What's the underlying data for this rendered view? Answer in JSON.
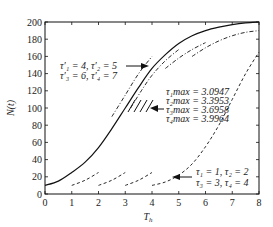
{
  "chart_data": {
    "type": "line",
    "title": "",
    "xlabel": "T_h",
    "ylabel": "N(t)",
    "xlim": [
      0,
      8
    ],
    "ylim": [
      0,
      200
    ],
    "xticks": [
      0,
      1,
      2,
      3,
      4,
      5,
      6,
      7,
      8
    ],
    "yticks": [
      0,
      20,
      40,
      60,
      80,
      100,
      120,
      140,
      160,
      180,
      200
    ],
    "grid": false,
    "legend": null,
    "series": [
      {
        "name": "N(t) solid",
        "style": "solid",
        "x": [
          0,
          0.5,
          1,
          1.5,
          2,
          2.5,
          3,
          3.5,
          4,
          4.5,
          5,
          5.5,
          6,
          6.5,
          7,
          7.5,
          8
        ],
        "y": [
          10,
          15,
          25,
          37,
          54,
          76,
          100,
          124,
          146,
          162,
          175,
          184,
          190,
          194,
          197,
          199,
          200
        ]
      },
      {
        "name": "tau_1 = 1 segment",
        "style": "dashed",
        "x": [
          1,
          1.5,
          2
        ],
        "y": [
          10,
          16,
          25
        ]
      },
      {
        "name": "tau_2 = 2 segment",
        "style": "dashed",
        "x": [
          2,
          2.5,
          3
        ],
        "y": [
          10,
          16,
          25
        ]
      },
      {
        "name": "tau_3 = 3 segment",
        "style": "dashed",
        "x": [
          3,
          3.5,
          4
        ],
        "y": [
          10,
          16,
          25
        ]
      },
      {
        "name": "tau_4 = 4 segment",
        "style": "dashed",
        "x": [
          4,
          4.5,
          5,
          5.5,
          6,
          6.5,
          7,
          7.5,
          8
        ],
        "y": [
          10,
          14,
          22,
          35,
          55,
          80,
          110,
          140,
          165
        ]
      },
      {
        "name": "tau'_1 = 4 segment",
        "style": "dashdot",
        "x": [
          2.5,
          3,
          3.5,
          4
        ],
        "y": [
          90,
          115,
          140,
          160
        ]
      },
      {
        "name": "tau'_2 = 5 segment",
        "style": "dashdot",
        "x": [
          3.2,
          3.6,
          4,
          4.5,
          5
        ],
        "y": [
          100,
          120,
          138,
          155,
          168
        ]
      },
      {
        "name": "tau'_3 = 6 segment",
        "style": "dashdot",
        "x": [
          4.5,
          5,
          5.5,
          6
        ],
        "y": [
          146,
          158,
          168,
          176
        ]
      },
      {
        "name": "tau'_4 = 7 segment",
        "style": "dashdot",
        "x": [
          5.5,
          6,
          6.5,
          7,
          7.5,
          8
        ],
        "y": [
          160,
          170,
          178,
          184,
          188,
          190
        ]
      }
    ],
    "annotations": [
      {
        "text_lines": [
          "τ'₁ = 4,  τ'₂ = 5",
          "τ'₃ = 6,  τ'₄ = 7"
        ],
        "arrow_to": [
          3.3,
          150
        ]
      },
      {
        "text_lines": [
          "τ₁max = 3.0947",
          "τ₂max = 3.3953",
          "τ₃max = 3.6958",
          "τ₄max = 3.9964"
        ],
        "arrow_to": [
          3.9,
          100
        ]
      },
      {
        "text_lines": [
          "τ₁ = 1, τ₂ = 2",
          "τ₃ = 3, τ₄ = 4"
        ],
        "arrow_to": [
          4.7,
          22
        ]
      }
    ]
  },
  "labels": {
    "xlabel_main": "T",
    "xlabel_sub": "h",
    "ylabel": "N(t)",
    "ann1_line1": "τ′₁ = 4,  τ′₂ = 5",
    "ann1_line2": "τ′₃ = 6,  τ′₄ = 7",
    "ann2_line1": "τ₁max = 3.0947",
    "ann2_line2": "τ₂max = 3.3953",
    "ann2_line3": "τ₃max = 3.6958",
    "ann2_line4": "τ₄max = 3.9964",
    "ann3_line1": "τ₁ = 1, τ₂ = 2",
    "ann3_line2": "τ₃ = 3, τ₄ = 4"
  }
}
